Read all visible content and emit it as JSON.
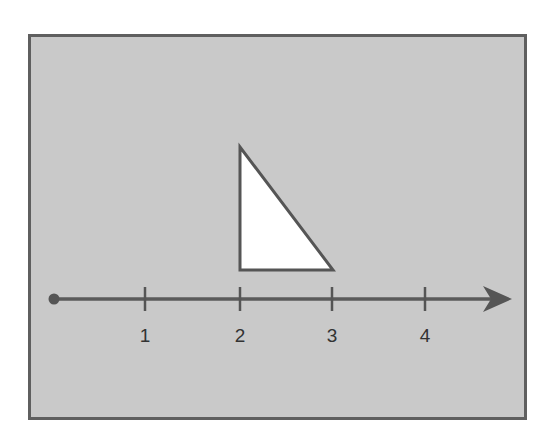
{
  "diagram": {
    "type": "number-line-with-triangle",
    "colors": {
      "panel_background": "#c9c9c9",
      "panel_border": "#5f5f5f",
      "line_color": "#555555",
      "triangle_fill": "#ffffff",
      "label_color": "#333333"
    },
    "number_line": {
      "start_marker": "filled-dot",
      "end_marker": "arrow-right",
      "ticks": [
        {
          "value": 1,
          "label": "1"
        },
        {
          "value": 2,
          "label": "2"
        },
        {
          "value": 3,
          "label": "3"
        },
        {
          "value": 4,
          "label": "4"
        }
      ]
    },
    "triangle": {
      "shape": "right-triangle",
      "fill": "white",
      "base_from": 2,
      "base_to": 3,
      "vertical_side_at": 2
    }
  }
}
